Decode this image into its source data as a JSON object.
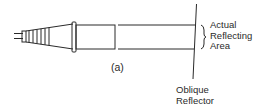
{
  "diagram": {
    "caption": "(a)",
    "labels": {
      "reflecting_area": [
        "Actual",
        "Reflecting",
        "Area"
      ],
      "reflector": [
        "Oblique",
        "Reflector"
      ]
    },
    "components": [
      "cable",
      "ferrule-taper",
      "flange",
      "probe-tube",
      "beam-path",
      "oblique-reflector",
      "brace"
    ],
    "colors": {
      "stroke": "#2a2a2a",
      "background": "#ffffff"
    }
  }
}
